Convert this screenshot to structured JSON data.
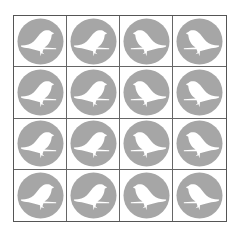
{
  "grid": {
    "rows": 4,
    "cols": 4,
    "circle_color": "#a6a6a6",
    "bird_color": "#ffffff",
    "cells": [
      {
        "icon": "bird-icon",
        "facing": "right"
      },
      {
        "icon": "bird-icon",
        "facing": "right"
      },
      {
        "icon": "bird-icon",
        "facing": "left"
      },
      {
        "icon": "bird-icon",
        "facing": "left"
      },
      {
        "icon": "bird-icon",
        "facing": "right"
      },
      {
        "icon": "bird-icon",
        "facing": "right"
      },
      {
        "icon": "bird-icon",
        "facing": "left"
      },
      {
        "icon": "bird-icon",
        "facing": "left"
      },
      {
        "icon": "bird-icon",
        "facing": "right"
      },
      {
        "icon": "bird-icon",
        "facing": "right"
      },
      {
        "icon": "bird-icon",
        "facing": "left"
      },
      {
        "icon": "bird-icon",
        "facing": "left"
      },
      {
        "icon": "bird-icon",
        "facing": "right"
      },
      {
        "icon": "bird-icon",
        "facing": "right"
      },
      {
        "icon": "bird-icon",
        "facing": "left"
      },
      {
        "icon": "bird-icon",
        "facing": "left"
      }
    ]
  }
}
